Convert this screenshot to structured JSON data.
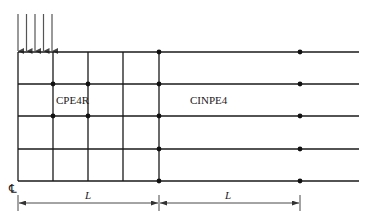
{
  "diagram": {
    "labels": {
      "refined_region": "CPE4R",
      "infinite_region": "CINPE4",
      "dim_left": "L",
      "dim_right": "L",
      "centerline": "℄"
    },
    "load": {
      "arrow_x": [
        18,
        26.5,
        35,
        43.5,
        52
      ],
      "y_start": 14,
      "y_end": 52
    },
    "grid": {
      "x_lines": [
        18,
        53,
        88,
        123,
        159
      ],
      "y_lines": [
        52,
        84,
        116,
        149,
        181
      ],
      "extended_x_end": 359
    },
    "nodes": [
      [
        53,
        84
      ],
      [
        88,
        84
      ],
      [
        159,
        84
      ],
      [
        53,
        116
      ],
      [
        88,
        116
      ],
      [
        159,
        116
      ],
      [
        159,
        52
      ],
      [
        159,
        149
      ],
      [
        159,
        181
      ],
      [
        300,
        52
      ],
      [
        300,
        84
      ],
      [
        300,
        116
      ],
      [
        300,
        149
      ],
      [
        300,
        181
      ]
    ],
    "dimension": {
      "y": 203,
      "x_left": 18,
      "x_mid": 159,
      "x_right": 300
    },
    "colors": {
      "line": "#1a1a1a",
      "arrow": "#555555",
      "dim": "#333333"
    }
  }
}
